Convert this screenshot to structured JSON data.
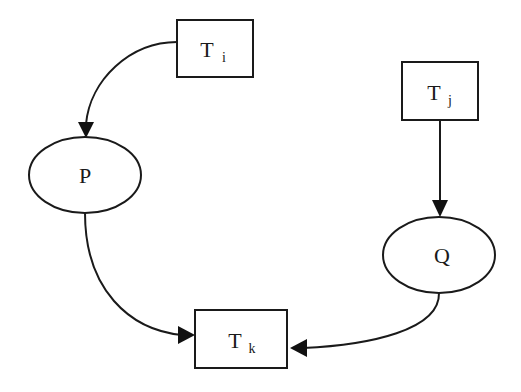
{
  "diagram": {
    "type": "dependency-graph",
    "colors": {
      "stroke": "#1a1a1a",
      "fill": "#ffffff",
      "background": "#ffffff"
    },
    "nodes": {
      "ti": {
        "shape": "rectangle",
        "label_main": "T",
        "label_sub": "i"
      },
      "tj": {
        "shape": "rectangle",
        "label_main": "T",
        "label_sub": "j"
      },
      "tk": {
        "shape": "rectangle",
        "label_main": "T",
        "label_sub": "k"
      },
      "p": {
        "shape": "ellipse",
        "label": "P"
      },
      "q": {
        "shape": "ellipse",
        "label": "Q"
      }
    },
    "edges": [
      {
        "from": "ti",
        "to": "p",
        "style": "curved"
      },
      {
        "from": "tj",
        "to": "q",
        "style": "straight"
      },
      {
        "from": "p",
        "to": "tk",
        "style": "curved"
      },
      {
        "from": "q",
        "to": "tk",
        "style": "curved"
      }
    ]
  }
}
